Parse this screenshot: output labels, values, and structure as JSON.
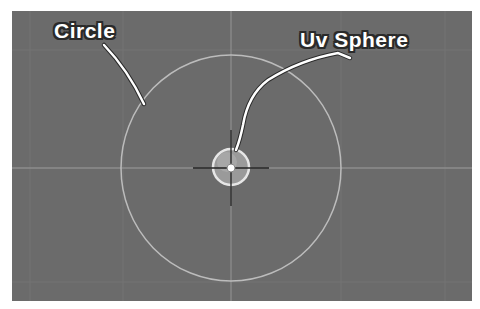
{
  "viewport": {
    "background": "#6b6b6b",
    "grid_color": "#7a7a7a",
    "axis_color": "#8a8a8a",
    "view": "top-orthographic"
  },
  "objects": [
    {
      "name": "Circle",
      "type": "circle-mesh",
      "color": "#bdbdbd"
    },
    {
      "name": "Uv Sphere",
      "type": "uv-sphere",
      "color": "#d9d9d9"
    }
  ],
  "callouts": {
    "circle_label": "Circle",
    "sphere_label": "Uv Sphere"
  },
  "cursor": {
    "icon": "3d-cursor-crosshair"
  }
}
